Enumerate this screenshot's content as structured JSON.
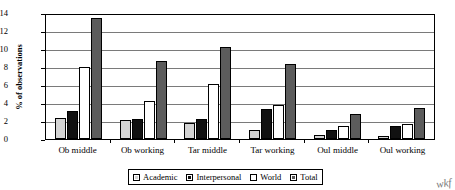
{
  "chart_data": {
    "type": "bar",
    "title": "",
    "xlabel": "",
    "ylabel": "% of observations",
    "ylim": [
      0,
      14
    ],
    "yticks": [
      0,
      2,
      4,
      6,
      8,
      10,
      12,
      14
    ],
    "grid": true,
    "legend_position": "bottom",
    "categories": [
      "Ob middle",
      "Ob working",
      "Tar middle",
      "Tar working",
      "Oul middle",
      "Oul working"
    ],
    "series": [
      {
        "name": "Academic",
        "color": "#d4d4d4",
        "values": [
          2.3,
          2.1,
          1.8,
          1.0,
          0.4,
          0.3
        ]
      },
      {
        "name": "Interpersonal",
        "color": "#111111",
        "values": [
          3.1,
          2.2,
          2.2,
          3.3,
          1.0,
          1.4
        ]
      },
      {
        "name": "World",
        "color": "#ffffff",
        "values": [
          8.0,
          4.2,
          6.1,
          3.8,
          1.4,
          1.7
        ]
      },
      {
        "name": "Total",
        "color": "#5c5c5c",
        "values": [
          13.4,
          8.7,
          10.2,
          8.3,
          2.8,
          3.4
        ]
      }
    ]
  },
  "annotations": {
    "scribble": "wkf"
  }
}
